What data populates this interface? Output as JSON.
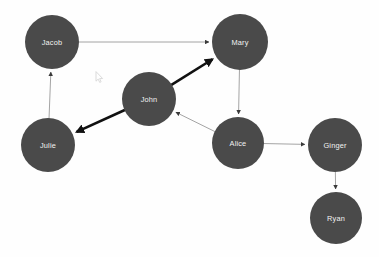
{
  "graph": {
    "title": "Social Network Graph",
    "background_color": "#fefefe",
    "node_color": "#4a4a4a",
    "node_label_color": "#f2f2f2",
    "thin_edge_color": "#9a9a9a",
    "thick_edge_color": "#111111",
    "node_count": "7",
    "edge_count": "8",
    "nodes": [
      {
        "id": "jacob",
        "label": "Jacob",
        "x": 52,
        "y": 42,
        "r": 27
      },
      {
        "id": "mary",
        "label": "Mary",
        "x": 240,
        "y": 42,
        "r": 28
      },
      {
        "id": "john",
        "label": "John",
        "x": 149,
        "y": 99,
        "r": 27
      },
      {
        "id": "julie",
        "label": "Julie",
        "x": 48,
        "y": 145,
        "r": 27
      },
      {
        "id": "alice",
        "label": "Alice",
        "x": 238,
        "y": 143,
        "r": 26
      },
      {
        "id": "ginger",
        "label": "Ginger",
        "x": 335,
        "y": 145,
        "r": 27
      },
      {
        "id": "ryan",
        "label": "Ryan",
        "x": 336,
        "y": 218,
        "r": 26
      }
    ],
    "edges": [
      {
        "id": "jacob-mary",
        "source": "jacob",
        "target": "mary",
        "weight": "thin",
        "directed": "true"
      },
      {
        "id": "julie-jacob",
        "source": "julie",
        "target": "jacob",
        "weight": "thin",
        "directed": "true"
      },
      {
        "id": "john-mary",
        "source": "john",
        "target": "mary",
        "weight": "thick",
        "directed": "true"
      },
      {
        "id": "john-julie",
        "source": "john",
        "target": "julie",
        "weight": "thick",
        "directed": "true"
      },
      {
        "id": "mary-alice",
        "source": "mary",
        "target": "alice",
        "weight": "thin",
        "directed": "true"
      },
      {
        "id": "alice-john",
        "source": "alice",
        "target": "john",
        "weight": "thin",
        "directed": "true"
      },
      {
        "id": "alice-ginger",
        "source": "alice",
        "target": "ginger",
        "weight": "thin",
        "directed": "true"
      },
      {
        "id": "ginger-ryan",
        "source": "ginger",
        "target": "ryan",
        "weight": "thin",
        "directed": "true"
      }
    ],
    "cursor": {
      "x": 95,
      "y": 69,
      "visible": "true"
    }
  }
}
